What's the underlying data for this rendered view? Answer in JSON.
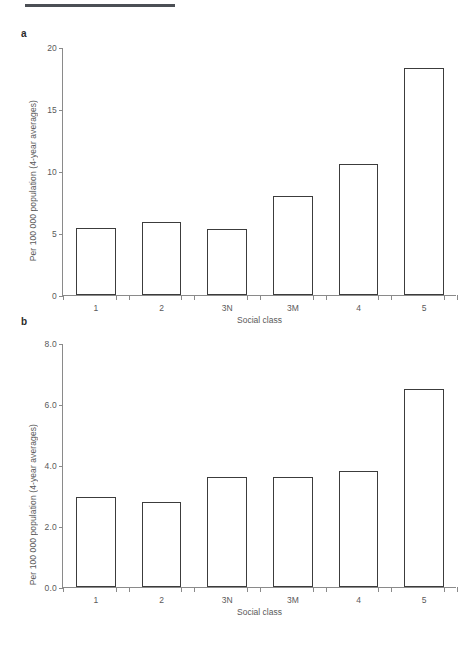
{
  "figure": {
    "panel_a_label": "a",
    "panel_b_label": "b",
    "rule_color": "#4b4f55",
    "bar_edge_color": "#3c3c3c",
    "bar_fill_color": "#ffffff",
    "axis_color": "#8a8a8a"
  },
  "chart_data": [
    {
      "type": "bar",
      "panel": "a",
      "title": "",
      "xlabel": "Social class",
      "ylabel": "Per 100 000 population (4-year averages)",
      "categories": [
        "1",
        "2",
        "3N",
        "3M",
        "4",
        "5"
      ],
      "values": [
        5.4,
        5.9,
        5.3,
        8.0,
        10.6,
        18.3
      ],
      "yticks": [
        "0",
        "5",
        "10",
        "15",
        "20"
      ],
      "ytick_values": [
        0,
        5,
        10,
        15,
        20
      ],
      "ylim": [
        0,
        20
      ],
      "grid": false,
      "legend": "none"
    },
    {
      "type": "bar",
      "panel": "b",
      "title": "",
      "xlabel": "Social class",
      "ylabel": "Per 100 000 population (4-year averages)",
      "categories": [
        "1",
        "2",
        "3N",
        "3M",
        "4",
        "5"
      ],
      "values": [
        2.95,
        2.8,
        3.6,
        3.6,
        3.8,
        6.5
      ],
      "yticks": [
        "0.0",
        "2.0",
        "4.0",
        "6.0",
        "8.0"
      ],
      "ytick_values": [
        0,
        2,
        4,
        6,
        8
      ],
      "ylim": [
        0,
        8
      ],
      "grid": false,
      "legend": "none"
    }
  ]
}
